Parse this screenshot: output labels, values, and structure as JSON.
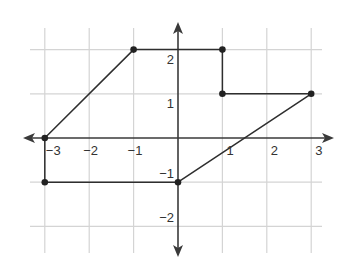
{
  "chart_data": {
    "type": "line",
    "title": "",
    "xlabel": "",
    "ylabel": "",
    "xlim": [
      -3,
      3
    ],
    "ylim": [
      -2,
      2
    ],
    "grid": true,
    "x_ticks": [
      -3,
      -2,
      -1,
      1,
      2,
      3
    ],
    "y_ticks": [
      2,
      1,
      -1,
      -2
    ],
    "x_tick_labels": [
      "−3",
      "−2",
      "−1",
      "1",
      "2",
      "3"
    ],
    "y_tick_labels": [
      "2",
      "1",
      "−1",
      "−2"
    ],
    "series": [
      {
        "name": "polygon",
        "closed": true,
        "points": [
          {
            "x": -3,
            "y": 0
          },
          {
            "x": -1,
            "y": 2
          },
          {
            "x": 1,
            "y": 2
          },
          {
            "x": 1,
            "y": 1
          },
          {
            "x": 3,
            "y": 1
          },
          {
            "x": 0,
            "y": -1
          },
          {
            "x": -3,
            "y": -1
          }
        ]
      }
    ]
  },
  "style": {
    "grid_color": "#d4d4d4",
    "axis_color": "#3a3a3a",
    "line_color": "#2e2e2e",
    "point_color": "#222222"
  }
}
